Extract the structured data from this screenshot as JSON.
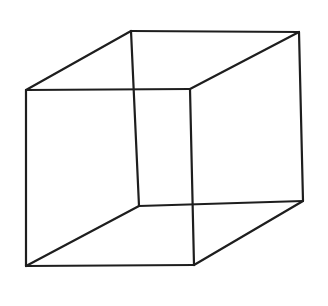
{
  "diagram": {
    "title": "",
    "type": "necker-cube-line-drawing",
    "stroke_color": "#1e1e1e",
    "background": "#ffffff",
    "vertices": {
      "front_top_left": [
        26,
        90
      ],
      "front_top_right": [
        190,
        89
      ],
      "front_bottom_left": [
        26,
        266
      ],
      "front_bottom_right": [
        194,
        265
      ],
      "back_top_left": [
        131,
        31
      ],
      "back_top_right": [
        299,
        32
      ],
      "back_bottom_left": [
        139,
        206
      ],
      "back_bottom_right": [
        303,
        201
      ]
    },
    "edges": [
      [
        "front_top_left",
        "front_top_right"
      ],
      [
        "front_top_right",
        "front_bottom_right"
      ],
      [
        "front_bottom_right",
        "front_bottom_left"
      ],
      [
        "front_bottom_left",
        "front_top_left"
      ],
      [
        "back_top_left",
        "back_top_right"
      ],
      [
        "back_top_right",
        "back_bottom_right"
      ],
      [
        "back_bottom_right",
        "back_bottom_left"
      ],
      [
        "back_bottom_left",
        "back_top_left"
      ],
      [
        "front_top_left",
        "back_top_left"
      ],
      [
        "front_top_right",
        "back_top_right"
      ],
      [
        "front_bottom_left",
        "back_bottom_left"
      ],
      [
        "front_bottom_right",
        "back_bottom_right"
      ]
    ]
  }
}
